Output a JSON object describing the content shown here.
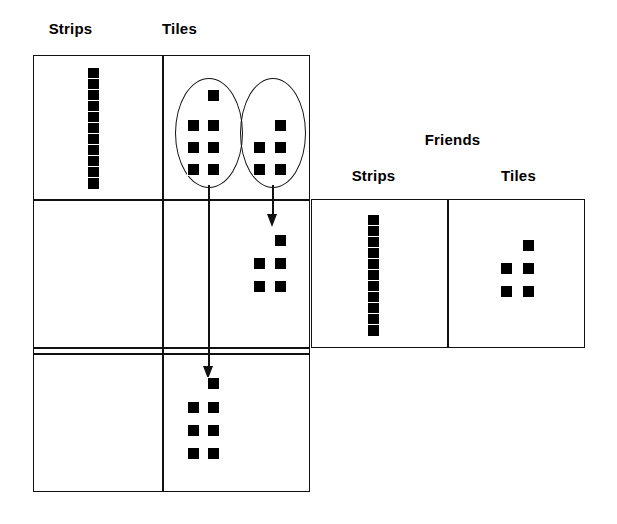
{
  "diagram": {
    "title_visible": false,
    "type": "place-value-manipulative-diagram",
    "colors": {
      "ink": "#111111",
      "tile_fill": "#000000",
      "background": "#ffffff"
    },
    "left_table": {
      "name": "left-place-value-table",
      "headers": [
        {
          "label": "Strips",
          "x": 65,
          "y": 28
        },
        {
          "label": "Tiles",
          "x": 178,
          "y": 28
        }
      ],
      "rows": [
        {
          "row_index": 0,
          "strips_count": 11,
          "tiles_count": 12,
          "tiles_grouped": true,
          "groups": [
            {
              "name": "oval-group-left",
              "tiles_count": 7
            },
            {
              "name": "oval-group-right",
              "tiles_count": 5
            }
          ]
        },
        {
          "row_index": 1,
          "strips_count": 0,
          "tiles_count": 5,
          "tiles_grouped": false,
          "groups": []
        },
        {
          "row_index": 2,
          "strips_count": 0,
          "tiles_count": 7,
          "tiles_grouped": false,
          "groups": []
        }
      ]
    },
    "right_table": {
      "name": "friends-place-value-table",
      "group_label": {
        "label": "Friends",
        "x": 452,
        "y": 140
      },
      "headers": [
        {
          "label": "Strips",
          "x": 372,
          "y": 176
        },
        {
          "label": "Tiles",
          "x": 518,
          "y": 176
        }
      ],
      "rows": [
        {
          "row_index": 0,
          "strips_count": 11,
          "tiles_count": 5
        }
      ]
    },
    "arrows": [
      {
        "name": "arrow-group-left-to-bottom-row",
        "from_group": "oval-group-left",
        "to_row": 2
      },
      {
        "name": "arrow-group-right-to-middle-row",
        "from_group": "oval-group-right",
        "to_row": 1
      }
    ]
  }
}
